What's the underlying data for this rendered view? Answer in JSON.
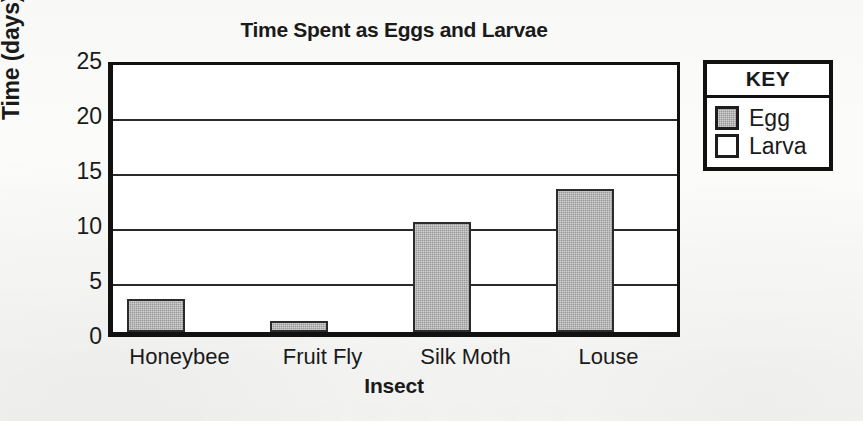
{
  "chart_data": {
    "type": "bar",
    "title": "Time Spent as Eggs and Larvae",
    "xlabel": "Insect",
    "ylabel": "Time (days)",
    "categories": [
      "Honeybee",
      "Fruit Fly",
      "Silk Moth",
      "Louse"
    ],
    "series": [
      {
        "name": "Egg",
        "values": [
          3,
          1,
          10,
          13
        ],
        "color": "#9a9a9a"
      },
      {
        "name": "Larva",
        "values": [
          0,
          0,
          0,
          0
        ],
        "color": "#ffffff"
      }
    ],
    "ylim": [
      0,
      25
    ],
    "ytick_labels": [
      "0",
      "5",
      "10",
      "15",
      "20",
      "25"
    ],
    "ytick_values": [
      0,
      5,
      10,
      15,
      20,
      25
    ],
    "grid": true,
    "legend_position": "right-outside",
    "legend_title": "KEY"
  },
  "legend": {
    "title": "KEY",
    "items": [
      {
        "label": "Egg",
        "swatch": "egg"
      },
      {
        "label": "Larva",
        "swatch": "larva"
      }
    ]
  }
}
